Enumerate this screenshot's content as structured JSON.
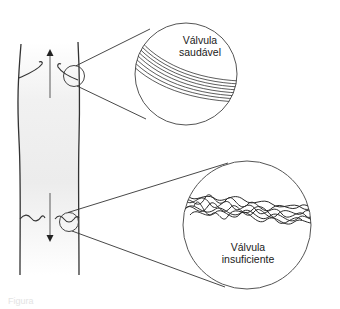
{
  "diagram": {
    "colors": {
      "stroke": "#2b2b2b",
      "vein_fill_top": "#ffffff",
      "vein_fill_mid": "#eeeeee",
      "arrow": "#555555",
      "background": "#ffffff"
    },
    "upper_section": {
      "flow_direction": "up",
      "arrow_icon": "arrow-up-icon",
      "zoom_label_line1": "Válvula",
      "zoom_label_line2": "saudável"
    },
    "lower_section": {
      "flow_direction": "down",
      "arrow_icon": "arrow-down-icon",
      "zoom_label_line1": "Válvula",
      "zoom_label_line2": "insuficiente"
    },
    "caption": "Figura"
  }
}
